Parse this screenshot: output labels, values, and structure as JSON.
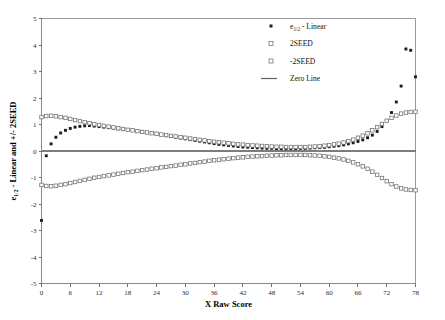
{
  "chart_data": {
    "type": "scatter",
    "title": "",
    "xlabel": "X Raw Score",
    "ylabel": "e1/2 - Linear and +/- 2SEED",
    "ylabel_parts": {
      "base": "e",
      "sub": "1/2",
      "rest": " - Linear and +/- 2SEED"
    },
    "xlim": [
      0,
      78
    ],
    "ylim": [
      -5,
      5
    ],
    "xticks": [
      0,
      6,
      12,
      18,
      24,
      30,
      36,
      42,
      48,
      54,
      60,
      66,
      72,
      78
    ],
    "yticks": [
      -5,
      -4,
      -3,
      -2,
      -1,
      0,
      1,
      2,
      3,
      4,
      5
    ],
    "grid": false,
    "legend_position": "top-right",
    "zero_line": 0,
    "x": [
      0,
      1,
      2,
      3,
      4,
      5,
      6,
      7,
      8,
      9,
      10,
      11,
      12,
      13,
      14,
      15,
      16,
      17,
      18,
      19,
      20,
      21,
      22,
      23,
      24,
      25,
      26,
      27,
      28,
      29,
      30,
      31,
      32,
      33,
      34,
      35,
      36,
      37,
      38,
      39,
      40,
      41,
      42,
      43,
      44,
      45,
      46,
      47,
      48,
      49,
      50,
      51,
      52,
      53,
      54,
      55,
      56,
      57,
      58,
      59,
      60,
      61,
      62,
      63,
      64,
      65,
      66,
      67,
      68,
      69,
      70,
      71,
      72,
      73,
      74,
      75,
      76,
      77,
      78
    ],
    "series": [
      {
        "name": "e1/2 - Linear",
        "marker": "filled-square",
        "color": "#1c1c1c",
        "values": [
          -2.62,
          -0.18,
          0.27,
          0.52,
          0.68,
          0.78,
          0.85,
          0.9,
          0.93,
          0.95,
          0.96,
          0.94,
          0.92,
          0.9,
          0.88,
          0.86,
          0.84,
          0.82,
          0.8,
          0.78,
          0.75,
          0.72,
          0.7,
          0.67,
          0.64,
          0.61,
          0.58,
          0.55,
          0.52,
          0.49,
          0.46,
          0.43,
          0.4,
          0.37,
          0.34,
          0.31,
          0.28,
          0.25,
          0.23,
          0.21,
          0.19,
          0.17,
          0.15,
          0.14,
          0.13,
          0.12,
          0.11,
          0.1,
          0.1,
          0.09,
          0.09,
          0.09,
          0.09,
          0.09,
          0.1,
          0.1,
          0.11,
          0.12,
          0.13,
          0.14,
          0.16,
          0.18,
          0.2,
          0.23,
          0.27,
          0.31,
          0.36,
          0.42,
          0.5,
          0.6,
          0.74,
          0.92,
          1.15,
          1.45,
          1.85,
          2.45,
          3.85,
          3.8,
          2.8
        ]
      },
      {
        "name": "2SEED",
        "marker": "open-square",
        "color": "#6e6e6e",
        "values": [
          1.28,
          1.32,
          1.33,
          1.31,
          1.28,
          1.25,
          1.21,
          1.17,
          1.13,
          1.09,
          1.05,
          1.01,
          0.98,
          0.95,
          0.92,
          0.89,
          0.86,
          0.83,
          0.8,
          0.78,
          0.75,
          0.72,
          0.7,
          0.67,
          0.65,
          0.62,
          0.6,
          0.57,
          0.55,
          0.52,
          0.5,
          0.47,
          0.45,
          0.42,
          0.4,
          0.37,
          0.35,
          0.33,
          0.31,
          0.29,
          0.27,
          0.25,
          0.24,
          0.22,
          0.21,
          0.2,
          0.19,
          0.18,
          0.17,
          0.16,
          0.16,
          0.15,
          0.15,
          0.15,
          0.15,
          0.15,
          0.16,
          0.17,
          0.18,
          0.2,
          0.22,
          0.25,
          0.28,
          0.32,
          0.37,
          0.43,
          0.5,
          0.58,
          0.67,
          0.78,
          0.9,
          1.02,
          1.14,
          1.25,
          1.34,
          1.41,
          1.45,
          1.47,
          1.48
        ]
      },
      {
        "name": "-2SEED",
        "marker": "open-square",
        "color": "#6e6e6e",
        "values": [
          -1.28,
          -1.32,
          -1.33,
          -1.31,
          -1.28,
          -1.25,
          -1.21,
          -1.17,
          -1.13,
          -1.09,
          -1.05,
          -1.01,
          -0.98,
          -0.95,
          -0.92,
          -0.89,
          -0.86,
          -0.83,
          -0.8,
          -0.78,
          -0.75,
          -0.72,
          -0.7,
          -0.67,
          -0.65,
          -0.62,
          -0.6,
          -0.57,
          -0.55,
          -0.52,
          -0.5,
          -0.47,
          -0.45,
          -0.42,
          -0.4,
          -0.37,
          -0.35,
          -0.33,
          -0.31,
          -0.29,
          -0.27,
          -0.25,
          -0.24,
          -0.22,
          -0.21,
          -0.2,
          -0.19,
          -0.18,
          -0.17,
          -0.16,
          -0.16,
          -0.15,
          -0.15,
          -0.15,
          -0.15,
          -0.15,
          -0.16,
          -0.17,
          -0.18,
          -0.2,
          -0.22,
          -0.25,
          -0.28,
          -0.32,
          -0.37,
          -0.43,
          -0.5,
          -0.58,
          -0.67,
          -0.78,
          -0.9,
          -1.02,
          -1.14,
          -1.25,
          -1.34,
          -1.41,
          -1.45,
          -1.47,
          -1.48
        ]
      }
    ],
    "legend": [
      {
        "label_base": "e",
        "label_sub": "1/2",
        "label_rest": " - Linear",
        "marker": "filled-square"
      },
      {
        "label_base": "2SEED",
        "label_sub": "",
        "label_rest": "",
        "marker": "open-square"
      },
      {
        "label_base": "-2SEED",
        "label_sub": "",
        "label_rest": "",
        "marker": "open-square"
      },
      {
        "label_base": "Zero Line",
        "label_sub": "",
        "label_rest": "",
        "marker": "line"
      }
    ]
  }
}
